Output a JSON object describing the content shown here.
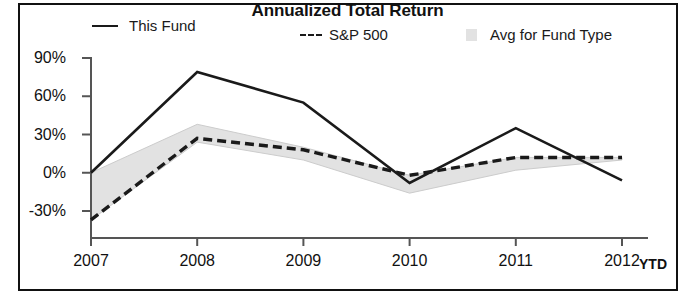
{
  "chart_data": {
    "type": "line",
    "title": "Annualized Total Return",
    "xlabel": "",
    "ylabel": "",
    "categories": [
      "2007",
      "2008",
      "2009",
      "2010",
      "2011",
      "2012"
    ],
    "x_axis_note": "YTD",
    "ylim": [
      -45,
      90
    ],
    "yticks": [
      90,
      60,
      30,
      0,
      -30
    ],
    "ytick_labels": [
      "90%",
      "60%",
      "30%",
      "0%",
      "-30%"
    ],
    "grid": false,
    "legend_position": "top",
    "series": [
      {
        "name": "This Fund",
        "style": "solid",
        "color": "#1a1a1a",
        "values": [
          0,
          79,
          55,
          -8,
          35,
          -6
        ]
      },
      {
        "name": "S&P 500",
        "style": "dashed",
        "color": "#1a1a1a",
        "values": [
          -37,
          27,
          18,
          -2,
          12,
          12
        ]
      },
      {
        "name": "Avg for Fund Type",
        "style": "band",
        "color": "#e2e2e2",
        "upper": [
          0,
          38,
          20,
          -2,
          12,
          12
        ],
        "lower": [
          -37,
          24,
          10,
          -16,
          2,
          10
        ]
      }
    ]
  },
  "legend": {
    "this_fund": "This Fund",
    "sp500": "S&P 500",
    "avg_fund_type": "Avg for Fund Type"
  },
  "axes": {
    "y_labels": [
      "90%",
      "60%",
      "30%",
      "0%",
      "-30%"
    ],
    "x_labels": [
      "2007",
      "2008",
      "2009",
      "2010",
      "2011",
      "2012"
    ],
    "ytd": "YTD"
  },
  "colors": {
    "line": "#1a1a1a",
    "band": "#e2e2e2",
    "axis": "#555555",
    "frame": "#111111"
  }
}
